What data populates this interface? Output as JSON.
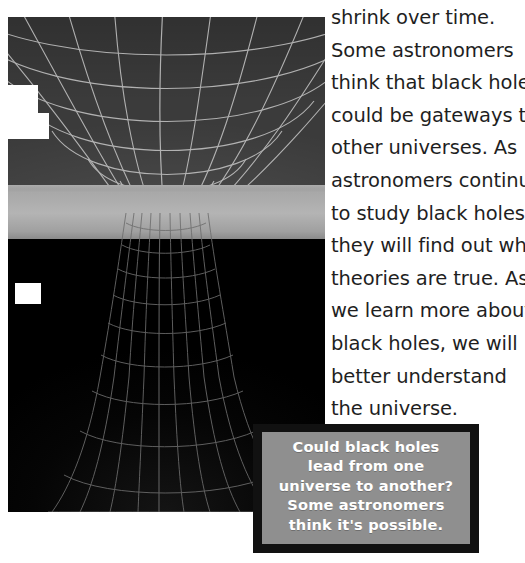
{
  "page": {
    "background_color": "#ffffff",
    "width": 525,
    "height": 563
  },
  "body_text": {
    "name": "black-holes-paragraph",
    "color": "#1f1f1f",
    "lines": [
      "shrink over time.",
      "Some astronomers",
      "think that black holes",
      "could be gateways to",
      "other universes. As",
      "astronomers continue",
      "to study black holes,",
      "they will find out which",
      "theories are true. As",
      "we learn more about",
      "black holes, we will",
      "better understand",
      "the universe."
    ],
    "full_text": "shrink over time. Some astronomers think that black holes could be gateways to other universes. As astronomers continue to study black holes, they will find out which theories are true. As we learn more about black holes, we will better understand the universe."
  },
  "figure": {
    "name": "wormhole-funnel-illustration",
    "alt": "Wireframe diagram of a funnel-shaped gravity well (wormhole) cut by a flat gray plane",
    "background_color": "#000000",
    "bowl_color": "#3b3b3b",
    "plane_color": "#b4b4b4",
    "grid_color": "#c9c9c9"
  },
  "caption": {
    "name": "figure-caption",
    "border_color": "#111111",
    "panel_color": "#8f8f8f",
    "text_color": "#ffffff",
    "lines": [
      "Could black holes",
      "lead from one",
      "universe to another?",
      "Some astronomers",
      "think it's possible."
    ],
    "full_text": "Could black holes lead from one universe to another? Some astronomers think it's possible."
  }
}
